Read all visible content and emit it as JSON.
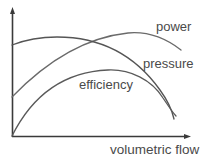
{
  "chart_data": {
    "type": "line",
    "title": "",
    "xlabel": "volumetric flow",
    "ylabel": "",
    "grid": false,
    "legend": "inline labels",
    "axis_ticks": "none (qualitative)",
    "series": [
      {
        "name": "power",
        "color": "#6a6a6a",
        "path": "M12,97 C40,68 80,38 128,33 C150,31 168,40 181,50",
        "label_pos": {
          "x": 156,
          "y": 20
        }
      },
      {
        "name": "pressure",
        "color": "#555555",
        "path": "M12,45 C30,38 45,37 57,37 C100,37 135,55 160,90 C168,101 172,110 174,119",
        "label_pos": {
          "x": 143,
          "y": 57
        }
      },
      {
        "name": "efficiency",
        "color": "#5a5a5a",
        "path": "M12,136 C30,100 60,72 108,70 C130,69 152,80 163,98 C169,107 173,113 176,116",
        "label_pos": {
          "x": 79,
          "y": 77
        }
      }
    ]
  },
  "labels": {
    "power": "power",
    "pressure": "pressure",
    "efficiency": "efficiency",
    "xaxis": "volumetric flow"
  }
}
